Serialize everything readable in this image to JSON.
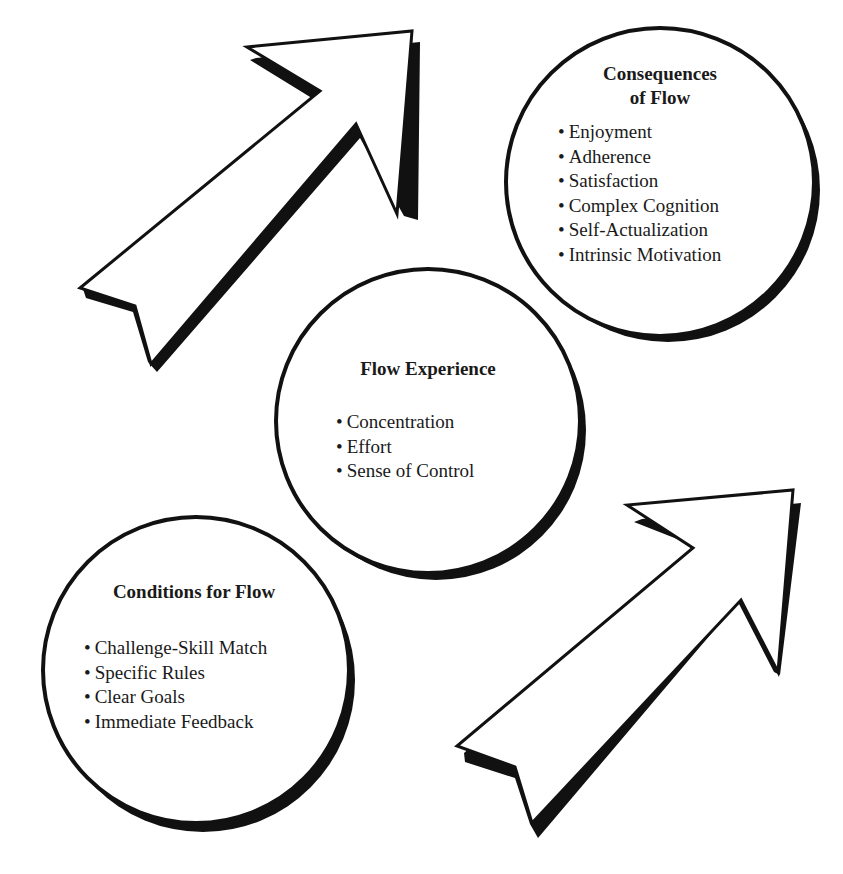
{
  "diagram": {
    "consequences": {
      "title_line1": "Consequences",
      "title_line2": "of Flow",
      "items": [
        "Enjoyment",
        "Adherence",
        "Satisfaction",
        "Complex Cognition",
        "Self-Actualization",
        "Intrinsic Motivation"
      ]
    },
    "experience": {
      "title": "Flow Experience",
      "items": [
        "Concentration",
        "Effort",
        "Sense of Control"
      ]
    },
    "conditions": {
      "title": "Conditions for Flow",
      "items": [
        "Challenge-Skill Match",
        "Specific Rules",
        "Clear Goals",
        "Immediate Feedback"
      ]
    },
    "arrows": [
      {
        "name": "arrow-top-left",
        "direction": "up-right"
      },
      {
        "name": "arrow-bottom-right",
        "direction": "up-right"
      }
    ],
    "colors": {
      "stroke": "#111111",
      "fill": "#ffffff"
    }
  }
}
